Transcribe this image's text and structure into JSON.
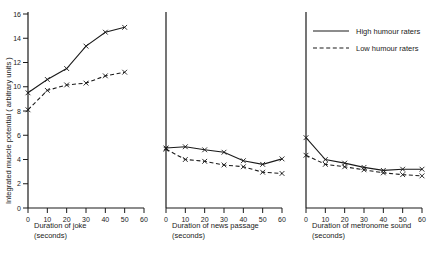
{
  "figure": {
    "ylabel": "Integrated muscle potential  ( arbitrary units )",
    "y_ticks": [
      0,
      2,
      4,
      6,
      8,
      10,
      12,
      14,
      16
    ],
    "ylim": [
      0,
      16
    ],
    "x_ticks": [
      0,
      10,
      20,
      30,
      40,
      50,
      60
    ],
    "xlim": [
      0,
      60
    ]
  },
  "legend": {
    "position": "top-right",
    "entries": [
      {
        "label": "High humour raters",
        "style": "solid"
      },
      {
        "label": "Low humour raters",
        "style": "dashed"
      }
    ]
  },
  "panels": [
    {
      "id": "joke",
      "xlabel_line1": "Duration  of  joke",
      "xlabel_line2": "(seconds)"
    },
    {
      "id": "news",
      "xlabel_line1": "Duration  of  news  passage",
      "xlabel_line2": "(seconds)"
    },
    {
      "id": "metronome",
      "xlabel_line1": "Duration  of  metronome  sound",
      "xlabel_line2": "(seconds)"
    }
  ],
  "chart_data": [
    {
      "type": "line",
      "title": "Duration of joke",
      "xlabel": "Duration of joke (seconds)",
      "ylabel": "Integrated muscle potential (arbitrary units)",
      "xlim": [
        0,
        60
      ],
      "ylim": [
        0,
        16
      ],
      "x": [
        0,
        10,
        20,
        30,
        40,
        50
      ],
      "grid": false,
      "series": [
        {
          "name": "High humour raters",
          "style": "solid",
          "values": [
            9.5,
            10.6,
            11.5,
            13.35,
            14.5,
            14.9
          ]
        },
        {
          "name": "Low humour raters",
          "style": "dashed",
          "values": [
            8.1,
            9.7,
            10.15,
            10.3,
            10.9,
            11.2
          ]
        }
      ]
    },
    {
      "type": "line",
      "title": "Duration of news passage",
      "xlabel": "Duration of news passage (seconds)",
      "ylabel": "Integrated muscle potential (arbitrary units)",
      "xlim": [
        0,
        60
      ],
      "ylim": [
        0,
        16
      ],
      "x": [
        0,
        10,
        20,
        30,
        40,
        50,
        60
      ],
      "grid": false,
      "series": [
        {
          "name": "High humour raters",
          "style": "solid",
          "values": [
            4.95,
            5.05,
            4.8,
            4.6,
            3.9,
            3.6,
            4.05
          ]
        },
        {
          "name": "Low humour raters",
          "style": "dashed",
          "values": [
            4.85,
            4.0,
            3.85,
            3.55,
            3.4,
            2.95,
            2.85
          ]
        }
      ]
    },
    {
      "type": "line",
      "title": "Duration of metronome sound",
      "xlabel": "Duration of metronome sound (seconds)",
      "ylabel": "Integrated muscle potential (arbitrary units)",
      "xlim": [
        0,
        60
      ],
      "ylim": [
        0,
        16
      ],
      "x": [
        0,
        10,
        20,
        30,
        40,
        50,
        60
      ],
      "grid": false,
      "series": [
        {
          "name": "High humour raters",
          "style": "solid",
          "values": [
            5.8,
            4.0,
            3.7,
            3.35,
            3.1,
            3.2,
            3.2
          ]
        },
        {
          "name": "Low humour raters",
          "style": "dashed",
          "values": [
            4.35,
            3.6,
            3.4,
            3.15,
            2.9,
            2.75,
            2.65
          ]
        }
      ]
    }
  ]
}
